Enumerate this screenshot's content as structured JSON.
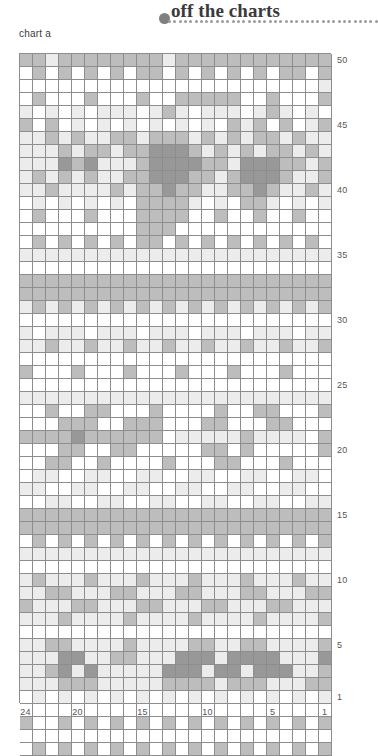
{
  "header": {
    "brand_title": "off the charts",
    "brand_dot_color": "#808080",
    "dotted_rule_color": "#9b9b9b",
    "dotted_rule_count": 40
  },
  "chart": {
    "caption": "chart a",
    "columns": 24,
    "rows": 50,
    "cell_size_px": 13,
    "grid_line_color": "#8d8d8d",
    "row_labels": [
      "50",
      "45",
      "40",
      "35",
      "30",
      "25",
      "20",
      "15",
      "10",
      "5",
      "1"
    ],
    "row_label_rows": [
      50,
      45,
      40,
      35,
      30,
      25,
      20,
      15,
      10,
      5,
      1
    ],
    "col_labels": [
      "24",
      "20",
      "15",
      "10",
      "5",
      "1"
    ],
    "col_label_columns": [
      24,
      20,
      15,
      10,
      5,
      1
    ],
    "palette": {
      "0": "#ffffff",
      "1": "#ececec",
      "2": "#bdbdbd",
      "3": "#989898"
    },
    "palette_names": [
      "white",
      "light-gray",
      "medium-gray",
      "dark-gray"
    ],
    "legend_note": "4-shade colorwork chart, read right to left",
    "grid": [
      [
        2,
        2,
        1,
        2,
        2,
        2,
        2,
        2,
        2,
        2,
        2,
        1,
        2,
        2,
        2,
        2,
        2,
        2,
        2,
        2,
        2,
        2,
        2,
        2
      ],
      [
        0,
        2,
        0,
        2,
        0,
        2,
        0,
        2,
        0,
        2,
        2,
        0,
        2,
        0,
        2,
        0,
        2,
        0,
        2,
        0,
        2,
        2,
        0,
        2
      ],
      [
        0,
        0,
        0,
        0,
        0,
        0,
        0,
        0,
        0,
        0,
        0,
        0,
        0,
        0,
        0,
        0,
        0,
        0,
        0,
        0,
        0,
        0,
        0,
        1
      ],
      [
        0,
        2,
        0,
        0,
        0,
        2,
        0,
        0,
        0,
        2,
        0,
        0,
        2,
        2,
        2,
        2,
        2,
        0,
        0,
        2,
        0,
        0,
        0,
        2
      ],
      [
        1,
        0,
        1,
        0,
        1,
        0,
        1,
        1,
        1,
        0,
        1,
        2,
        1,
        0,
        1,
        1,
        1,
        0,
        1,
        2,
        1,
        0,
        1,
        0
      ],
      [
        2,
        0,
        2,
        0,
        1,
        0,
        1,
        0,
        1,
        0,
        1,
        0,
        1,
        0,
        1,
        0,
        2,
        1,
        2,
        0,
        2,
        0,
        1,
        2
      ],
      [
        1,
        1,
        2,
        1,
        2,
        1,
        1,
        2,
        2,
        1,
        2,
        2,
        2,
        1,
        2,
        1,
        2,
        1,
        2,
        2,
        1,
        2,
        1,
        1
      ],
      [
        1,
        1,
        1,
        2,
        1,
        2,
        2,
        1,
        2,
        2,
        3,
        3,
        3,
        2,
        1,
        2,
        1,
        2,
        1,
        2,
        2,
        1,
        2,
        1
      ],
      [
        1,
        1,
        1,
        3,
        2,
        3,
        1,
        1,
        1,
        2,
        3,
        3,
        3,
        3,
        2,
        2,
        1,
        3,
        3,
        3,
        2,
        2,
        1,
        2
      ],
      [
        1,
        2,
        1,
        2,
        1,
        2,
        1,
        1,
        2,
        2,
        3,
        3,
        3,
        2,
        2,
        1,
        2,
        3,
        3,
        3,
        2,
        1,
        1,
        2
      ],
      [
        1,
        1,
        2,
        1,
        1,
        1,
        1,
        2,
        1,
        2,
        2,
        3,
        2,
        2,
        1,
        1,
        2,
        2,
        3,
        2,
        1,
        1,
        2,
        1
      ],
      [
        0,
        1,
        0,
        1,
        0,
        1,
        0,
        1,
        0,
        2,
        2,
        2,
        2,
        1,
        0,
        1,
        0,
        2,
        2,
        1,
        0,
        1,
        0,
        1
      ],
      [
        0,
        2,
        0,
        0,
        0,
        2,
        0,
        0,
        0,
        2,
        2,
        2,
        2,
        0,
        0,
        2,
        0,
        0,
        2,
        0,
        0,
        2,
        0,
        0
      ],
      [
        0,
        0,
        0,
        0,
        0,
        0,
        0,
        0,
        0,
        2,
        2,
        2,
        0,
        0,
        0,
        0,
        0,
        0,
        0,
        0,
        0,
        0,
        0,
        0
      ],
      [
        0,
        2,
        0,
        2,
        0,
        2,
        0,
        2,
        0,
        2,
        2,
        0,
        2,
        0,
        2,
        0,
        2,
        0,
        2,
        0,
        2,
        0,
        2,
        0
      ],
      [
        1,
        1,
        1,
        1,
        1,
        1,
        1,
        1,
        1,
        1,
        1,
        1,
        1,
        1,
        1,
        1,
        1,
        1,
        1,
        1,
        1,
        1,
        1,
        1
      ],
      [
        0,
        0,
        0,
        0,
        0,
        0,
        0,
        0,
        0,
        0,
        0,
        0,
        0,
        0,
        0,
        0,
        0,
        0,
        0,
        0,
        0,
        0,
        0,
        0
      ],
      [
        2,
        2,
        2,
        2,
        2,
        2,
        2,
        2,
        2,
        2,
        2,
        2,
        2,
        2,
        2,
        2,
        2,
        2,
        2,
        2,
        2,
        2,
        2,
        2
      ],
      [
        2,
        2,
        2,
        2,
        2,
        2,
        2,
        2,
        2,
        2,
        2,
        2,
        2,
        2,
        2,
        2,
        2,
        2,
        2,
        2,
        2,
        2,
        2,
        2
      ],
      [
        1,
        2,
        1,
        2,
        1,
        2,
        1,
        2,
        1,
        2,
        1,
        2,
        1,
        2,
        1,
        2,
        1,
        2,
        1,
        2,
        1,
        2,
        1,
        2
      ],
      [
        0,
        0,
        0,
        0,
        0,
        0,
        0,
        0,
        0,
        0,
        0,
        0,
        0,
        0,
        0,
        0,
        0,
        0,
        0,
        0,
        0,
        0,
        0,
        0
      ],
      [
        1,
        0,
        1,
        1,
        1,
        0,
        1,
        1,
        1,
        0,
        1,
        1,
        1,
        0,
        1,
        1,
        1,
        0,
        1,
        1,
        1,
        0,
        1,
        1
      ],
      [
        1,
        1,
        2,
        1,
        1,
        2,
        1,
        1,
        2,
        1,
        1,
        2,
        1,
        1,
        2,
        1,
        1,
        2,
        1,
        1,
        2,
        1,
        1,
        2
      ],
      [
        0,
        0,
        0,
        0,
        0,
        0,
        0,
        0,
        0,
        0,
        0,
        0,
        0,
        0,
        0,
        0,
        0,
        0,
        0,
        0,
        0,
        0,
        0,
        0
      ],
      [
        2,
        0,
        0,
        0,
        2,
        0,
        0,
        0,
        2,
        0,
        0,
        0,
        2,
        0,
        0,
        0,
        2,
        0,
        0,
        0,
        2,
        0,
        0,
        0
      ],
      [
        0,
        0,
        0,
        0,
        0,
        0,
        0,
        0,
        0,
        0,
        0,
        0,
        0,
        0,
        0,
        0,
        0,
        0,
        0,
        0,
        0,
        0,
        0,
        0
      ],
      [
        1,
        1,
        1,
        1,
        1,
        1,
        1,
        1,
        1,
        1,
        1,
        1,
        1,
        1,
        1,
        1,
        1,
        1,
        1,
        1,
        1,
        1,
        1,
        1
      ],
      [
        0,
        0,
        2,
        0,
        0,
        2,
        2,
        0,
        0,
        0,
        2,
        0,
        0,
        0,
        0,
        2,
        0,
        0,
        2,
        2,
        0,
        0,
        0,
        2
      ],
      [
        0,
        0,
        0,
        2,
        2,
        2,
        0,
        0,
        2,
        2,
        2,
        0,
        0,
        0,
        2,
        2,
        0,
        0,
        0,
        2,
        2,
        0,
        0,
        0
      ],
      [
        2,
        2,
        2,
        2,
        3,
        2,
        2,
        2,
        2,
        2,
        2,
        0,
        1,
        1,
        1,
        1,
        1,
        2,
        1,
        1,
        1,
        1,
        0,
        2
      ],
      [
        0,
        0,
        0,
        2,
        2,
        0,
        0,
        2,
        2,
        0,
        0,
        0,
        0,
        0,
        2,
        2,
        0,
        2,
        0,
        0,
        0,
        0,
        0,
        2
      ],
      [
        0,
        0,
        2,
        2,
        0,
        0,
        2,
        0,
        0,
        0,
        0,
        2,
        0,
        0,
        0,
        2,
        2,
        0,
        0,
        0,
        2,
        0,
        0,
        0
      ],
      [
        0,
        1,
        1,
        0,
        0,
        1,
        1,
        0,
        0,
        1,
        1,
        0,
        0,
        1,
        1,
        0,
        0,
        1,
        1,
        0,
        0,
        1,
        1,
        0
      ],
      [
        1,
        1,
        0,
        0,
        1,
        1,
        0,
        0,
        1,
        1,
        0,
        0,
        1,
        1,
        0,
        0,
        1,
        1,
        0,
        0,
        1,
        1,
        0,
        0
      ],
      [
        0,
        0,
        1,
        1,
        0,
        0,
        1,
        1,
        0,
        0,
        1,
        1,
        0,
        0,
        1,
        1,
        0,
        0,
        1,
        1,
        0,
        0,
        1,
        1
      ],
      [
        2,
        2,
        2,
        2,
        2,
        2,
        2,
        2,
        2,
        2,
        2,
        2,
        2,
        2,
        2,
        2,
        2,
        2,
        2,
        2,
        2,
        2,
        2,
        2
      ],
      [
        2,
        2,
        2,
        2,
        2,
        2,
        2,
        2,
        2,
        2,
        2,
        2,
        2,
        2,
        2,
        2,
        2,
        2,
        2,
        2,
        2,
        2,
        2,
        2
      ],
      [
        0,
        2,
        0,
        2,
        0,
        2,
        0,
        2,
        0,
        2,
        0,
        2,
        0,
        2,
        0,
        2,
        0,
        2,
        0,
        2,
        0,
        2,
        0,
        2
      ],
      [
        1,
        1,
        1,
        1,
        1,
        1,
        1,
        1,
        1,
        1,
        1,
        1,
        1,
        1,
        1,
        1,
        1,
        1,
        1,
        1,
        1,
        1,
        1,
        1
      ],
      [
        0,
        0,
        0,
        0,
        0,
        0,
        0,
        0,
        0,
        0,
        0,
        0,
        0,
        0,
        0,
        0,
        0,
        0,
        0,
        0,
        0,
        0,
        0,
        0
      ],
      [
        1,
        2,
        1,
        1,
        1,
        2,
        1,
        1,
        1,
        2,
        1,
        1,
        1,
        2,
        1,
        1,
        1,
        2,
        1,
        1,
        1,
        2,
        1,
        1
      ],
      [
        1,
        1,
        2,
        2,
        1,
        1,
        1,
        2,
        2,
        1,
        1,
        1,
        2,
        2,
        1,
        1,
        1,
        2,
        2,
        1,
        1,
        1,
        2,
        2
      ],
      [
        2,
        1,
        1,
        1,
        2,
        2,
        1,
        1,
        1,
        2,
        2,
        1,
        1,
        1,
        2,
        2,
        1,
        1,
        1,
        2,
        2,
        1,
        1,
        1
      ],
      [
        1,
        1,
        1,
        2,
        1,
        1,
        1,
        1,
        2,
        1,
        1,
        1,
        1,
        2,
        1,
        1,
        1,
        1,
        2,
        1,
        1,
        1,
        1,
        2
      ],
      [
        0,
        0,
        0,
        0,
        0,
        0,
        0,
        0,
        0,
        0,
        0,
        0,
        0,
        0,
        0,
        0,
        0,
        0,
        0,
        0,
        0,
        0,
        0,
        0
      ],
      [
        1,
        1,
        2,
        2,
        1,
        1,
        1,
        1,
        2,
        1,
        1,
        1,
        1,
        2,
        2,
        1,
        1,
        2,
        2,
        1,
        1,
        1,
        1,
        2
      ],
      [
        1,
        1,
        1,
        3,
        3,
        1,
        1,
        2,
        2,
        1,
        1,
        1,
        3,
        3,
        3,
        1,
        3,
        3,
        3,
        3,
        1,
        1,
        1,
        3
      ],
      [
        1,
        1,
        2,
        3,
        1,
        3,
        1,
        1,
        1,
        1,
        1,
        3,
        3,
        3,
        1,
        3,
        3,
        1,
        3,
        3,
        3,
        1,
        1,
        2
      ],
      [
        1,
        1,
        1,
        2,
        2,
        2,
        1,
        1,
        1,
        1,
        1,
        2,
        2,
        2,
        2,
        1,
        2,
        2,
        2,
        1,
        1,
        1,
        2,
        2
      ],
      [
        0,
        1,
        0,
        1,
        0,
        1,
        0,
        1,
        0,
        1,
        0,
        1,
        0,
        1,
        0,
        1,
        0,
        1,
        0,
        1,
        0,
        1,
        0,
        1
      ],
      [
        0,
        0,
        0,
        0,
        0,
        0,
        0,
        0,
        0,
        0,
        0,
        0,
        0,
        0,
        0,
        0,
        0,
        0,
        0,
        0,
        0,
        0,
        0,
        0
      ],
      [
        2,
        0,
        0,
        2,
        0,
        2,
        0,
        2,
        0,
        2,
        0,
        2,
        0,
        2,
        0,
        2,
        0,
        2,
        0,
        2,
        0,
        2,
        0,
        2
      ],
      [
        0,
        0,
        0,
        0,
        0,
        0,
        0,
        0,
        0,
        0,
        0,
        0,
        0,
        0,
        0,
        0,
        0,
        0,
        0,
        0,
        0,
        0,
        0,
        0
      ],
      [
        0,
        2,
        0,
        2,
        0,
        2,
        0,
        2,
        0,
        2,
        0,
        2,
        0,
        2,
        0,
        2,
        0,
        2,
        0,
        2,
        0,
        2,
        0,
        2
      ]
    ]
  }
}
